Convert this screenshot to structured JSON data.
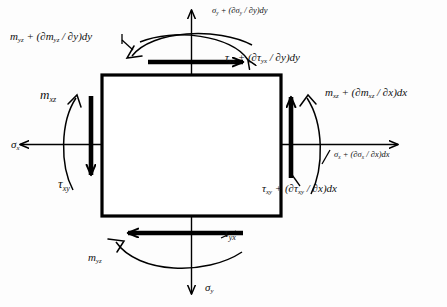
{
  "figure": {
    "type": "stress-element-free-body-diagram",
    "element": {
      "shape": "square",
      "x": 102,
      "y": 75,
      "width": 179,
      "height": 141,
      "stroke": "#000000",
      "stroke_width": 3.2
    },
    "colors": {
      "ink": "#000000",
      "background": "#ffffff"
    }
  },
  "labels": {
    "top_normal": {
      "sym": "σ",
      "sub": "y",
      "text": " + (∂σ",
      "sub2": "y",
      "text2": " / ∂y)dy",
      "size": "sz-sm"
    },
    "top_shear": {
      "sym": "τ",
      "sub": "yx",
      "text": " + (∂τ",
      "sub2": "yx",
      "text2": " / ∂y)dy",
      "size": "sz-md"
    },
    "top_moment": {
      "sym": "m",
      "sub": "yz",
      "text": " + (∂m",
      "sub2": "yz",
      "text2": " / ∂y)dy",
      "size": "sz-md"
    },
    "right_moment": {
      "sym": "m",
      "sub": "xz",
      "text": " + (∂m",
      "sub2": "xz",
      "text2": " / ∂x)dx",
      "size": "sz-md"
    },
    "right_normal": {
      "sym": "σ",
      "sub": "x",
      "text": " + (∂σ",
      "sub2": "x",
      "text2": " / ∂x)dx",
      "size": "sz-sm"
    },
    "right_shear": {
      "sym": "τ",
      "sub": "xy",
      "text": " + (∂τ",
      "sub2": "xy",
      "text2": " / ∂x)dx",
      "size": "sz-md"
    },
    "left_moment": {
      "sym": "m",
      "sub": "xz",
      "size": "sz-lg"
    },
    "left_normal": {
      "sym": "σ",
      "sub": "x",
      "size": "sz-md"
    },
    "left_shear": {
      "sym": "τ",
      "sub": "xy",
      "size": "sz-lg"
    },
    "bottom_shear": {
      "sym": "τ",
      "sub": "yx",
      "size": "sz-lg"
    },
    "bottom_moment": {
      "sym": "m",
      "sub": "yz",
      "size": "sz-md"
    },
    "bottom_normal": {
      "sym": "σ",
      "sub": "y",
      "size": "sz-md"
    }
  }
}
